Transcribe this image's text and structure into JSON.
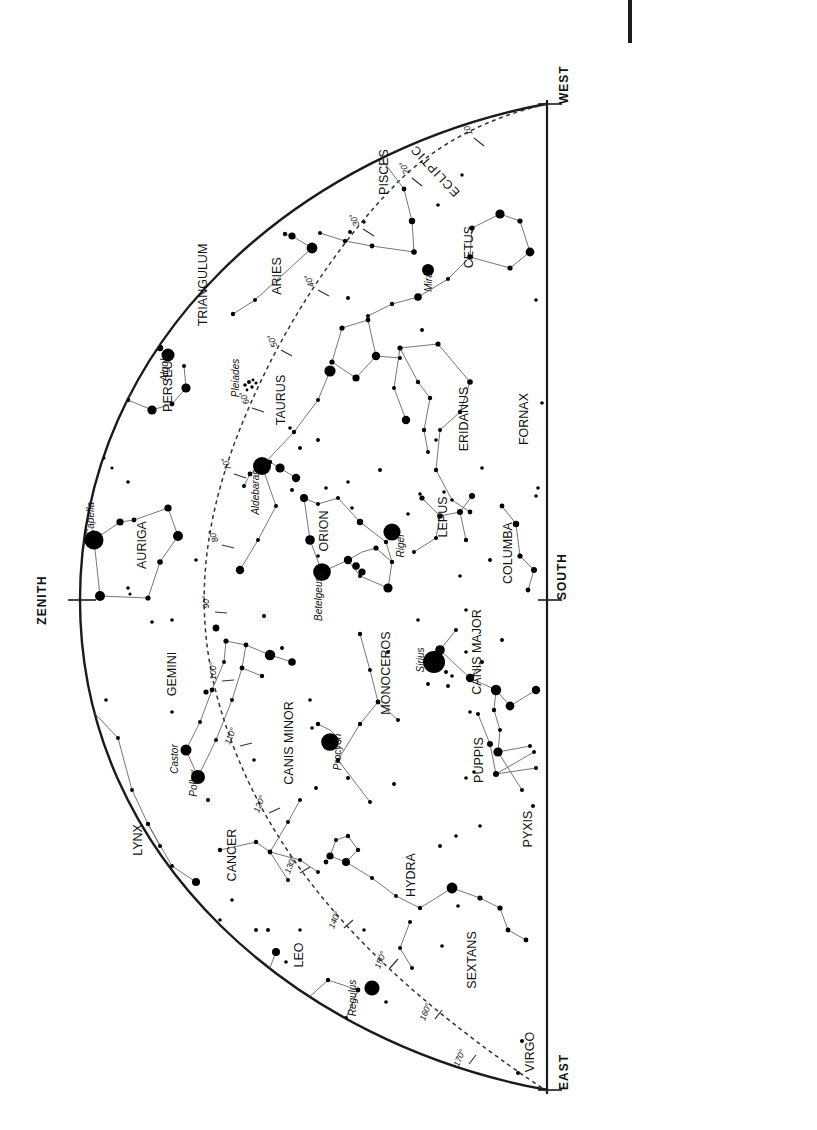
{
  "chart_data": {
    "type": "scatter",
    "orientation": "page rotated 90 degrees counter-clockwise",
    "projection": "half-dome horizon map",
    "horizon_labels": [
      "WEST",
      "SOUTH",
      "EAST"
    ],
    "zenith_label": "ZENITH",
    "ecliptic_label": "ECLIPTIC",
    "ecliptic_degree_ticks": [
      "10°",
      "20°",
      "30°",
      "40°",
      "50°",
      "60°",
      "70°",
      "80°",
      "90°",
      "100°",
      "110°",
      "120°",
      "130°",
      "140°",
      "150°",
      "160°",
      "170°"
    ],
    "constellations": [
      "PISCES",
      "CETUS",
      "ARIES",
      "TRIANGULUM",
      "PERSEUS",
      "TAURUS",
      "AURIGA",
      "ERIDANUS",
      "FORNAX",
      "ORION",
      "LEPUS",
      "COLUMBA",
      "GEMINI",
      "MONOCEROS",
      "CANIS MAJOR",
      "CANIS MINOR",
      "PUPPIS",
      "PYXIS",
      "LYNX",
      "CANCER",
      "HYDRA",
      "LEO",
      "SEXTANS",
      "VIRGO"
    ],
    "named_stars": [
      "Algol",
      "Capella",
      "Aldebaran",
      "Pleiades",
      "Mira",
      "Betelgeuse",
      "Rigel",
      "Sirius",
      "Procyon",
      "Castor",
      "Pollux",
      "Regulus"
    ],
    "ylabel": "",
    "xlabel": "",
    "grid": false,
    "legend": "none"
  },
  "labels": {
    "west": "WEST",
    "south": "SOUTH",
    "east": "EAST",
    "zenith": "ZENITH",
    "ecliptic": "ECLIPTIC"
  },
  "constellations": [
    {
      "name": "PISCES",
      "x": 388,
      "y": 172
    },
    {
      "name": "CETUS",
      "x": 473,
      "y": 247
    },
    {
      "name": "ARIES",
      "x": 281,
      "y": 276
    },
    {
      "name": "TRIANGULUM",
      "x": 207,
      "y": 285
    },
    {
      "name": "PERSEUS",
      "x": 172,
      "y": 382
    },
    {
      "name": "TAURUS",
      "x": 285,
      "y": 400
    },
    {
      "name": "AURIGA",
      "x": 146,
      "y": 545
    },
    {
      "name": "ERIDANUS",
      "x": 468,
      "y": 419
    },
    {
      "name": "FORNAX",
      "x": 528,
      "y": 419
    },
    {
      "name": "ORION",
      "x": 328,
      "y": 531
    },
    {
      "name": "LEPUS",
      "x": 447,
      "y": 517
    },
    {
      "name": "COLUMBA",
      "x": 512,
      "y": 553
    },
    {
      "name": "GEMINI",
      "x": 176,
      "y": 674
    },
    {
      "name": "MONOCEROS",
      "x": 390,
      "y": 673
    },
    {
      "name": "CANIS MAJOR",
      "x": 481,
      "y": 652
    },
    {
      "name": "CANIS MINOR",
      "x": 293,
      "y": 743
    },
    {
      "name": "PUPPIS",
      "x": 483,
      "y": 760
    },
    {
      "name": "PYXIS",
      "x": 532,
      "y": 829
    },
    {
      "name": "LYNX",
      "x": 142,
      "y": 840
    },
    {
      "name": "CANCER",
      "x": 236,
      "y": 855
    },
    {
      "name": "HYDRA",
      "x": 415,
      "y": 875
    },
    {
      "name": "LEO",
      "x": 303,
      "y": 955
    },
    {
      "name": "SEXTANS",
      "x": 476,
      "y": 960
    },
    {
      "name": "VIRGO",
      "x": 534,
      "y": 1052
    }
  ],
  "stars_named": [
    {
      "name": "Algol",
      "x": 168,
      "y": 370
    },
    {
      "name": "Capella",
      "x": 94,
      "y": 519
    },
    {
      "name": "Pleiades",
      "x": 239,
      "y": 378
    },
    {
      "name": "Aldebaran",
      "x": 259,
      "y": 492
    },
    {
      "name": "Mira",
      "x": 432,
      "y": 282
    },
    {
      "name": "Betelgeuse",
      "x": 322,
      "y": 596
    },
    {
      "name": "Rigel",
      "x": 404,
      "y": 546
    },
    {
      "name": "Sirius",
      "x": 424,
      "y": 660
    },
    {
      "name": "Procyon",
      "x": 341,
      "y": 752
    },
    {
      "name": "Castor",
      "x": 178,
      "y": 759
    },
    {
      "name": "Pollux",
      "x": 197,
      "y": 783
    },
    {
      "name": "Regulus",
      "x": 356,
      "y": 998
    }
  ],
  "ecliptic_ticks": [
    {
      "label": "10°",
      "x": 470,
      "y": 128
    },
    {
      "label": "20°",
      "x": 407,
      "y": 167
    },
    {
      "label": "30°",
      "x": 357,
      "y": 219
    },
    {
      "label": "40°",
      "x": 312,
      "y": 280
    },
    {
      "label": "50°",
      "x": 275,
      "y": 340
    },
    {
      "label": "60°",
      "x": 247,
      "y": 397
    },
    {
      "label": "70°",
      "x": 229,
      "y": 463
    },
    {
      "label": "80°",
      "x": 216,
      "y": 535
    },
    {
      "label": "90°",
      "x": 209,
      "y": 602
    },
    {
      "label": "100°",
      "x": 216,
      "y": 671
    },
    {
      "label": "110°",
      "x": 233,
      "y": 737
    },
    {
      "label": "120°",
      "x": 262,
      "y": 805
    },
    {
      "label": "130°",
      "x": 293,
      "y": 866
    },
    {
      "label": "140°",
      "x": 337,
      "y": 921
    },
    {
      "label": "150°",
      "x": 383,
      "y": 961
    },
    {
      "label": "160°",
      "x": 428,
      "y": 1013
    },
    {
      "label": "170°",
      "x": 462,
      "y": 1059
    }
  ],
  "caption_upper": {
    "rows": [
      {
        "date": "October 21 at",
        "time": "4",
        "unit": "h"
      },
      {
        "date": "November 21 at",
        "time": "2",
        "unit": "h"
      },
      {
        "date": "December 21 at midnight",
        "time": "",
        "unit": ""
      },
      {
        "date": "January 21 at",
        "time": "22",
        "unit": "h"
      },
      {
        "date": "February 21 at",
        "time": "20",
        "unit": "h"
      }
    ]
  },
  "caption_lower": {
    "rows": [
      {
        "date": "October 6 at",
        "time": "5",
        "unit": "h"
      },
      {
        "date": "November 6 at",
        "time": "3",
        "unit": "h"
      },
      {
        "date": "December 6 at",
        "time": "1",
        "unit": "h"
      },
      {
        "date": "January 6 at",
        "time": "23",
        "unit": "h"
      },
      {
        "date": "February 6 at",
        "time": "21",
        "unit": "h"
      }
    ]
  },
  "colors": {
    "ink": "#111111",
    "star": "#000000",
    "line": "#555555",
    "ecliptic": "#333333",
    "background": "#ffffff"
  }
}
